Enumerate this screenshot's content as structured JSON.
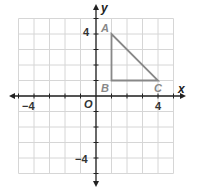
{
  "diagram": {
    "type": "coordinate-plane",
    "x_axis_label": "x",
    "y_axis_label": "y",
    "origin_label": "O",
    "x_tick_labels": [
      {
        "value": -4,
        "text": "−4"
      },
      {
        "value": 4,
        "text": "4"
      }
    ],
    "y_tick_labels": [
      {
        "value": 4,
        "text": "4"
      },
      {
        "value": -4,
        "text": "−4"
      }
    ],
    "range": {
      "xmin": -5,
      "xmax": 5,
      "ymin": -5,
      "ymax": 5
    },
    "triangle": {
      "color": "#888888",
      "vertices": [
        {
          "label": "A",
          "x": 1,
          "y": 4
        },
        {
          "label": "B",
          "x": 1,
          "y": 1
        },
        {
          "label": "C",
          "x": 4,
          "y": 1
        }
      ]
    }
  }
}
